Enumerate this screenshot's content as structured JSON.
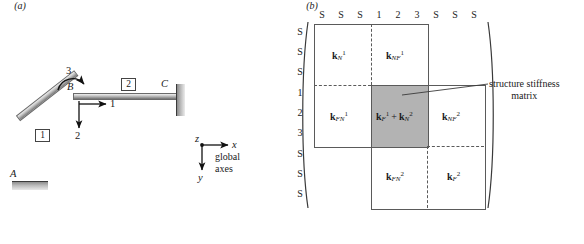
{
  "figure": {
    "panel_a": {
      "caption": "(a)",
      "joints": [
        {
          "name": "A",
          "role": "fixed-support-left"
        },
        {
          "name": "B",
          "role": "free-joint"
        },
        {
          "name": "C",
          "role": "fixed-support-right"
        }
      ],
      "members": [
        {
          "label": "1",
          "from": "A",
          "to": "B"
        },
        {
          "label": "2",
          "from": "B",
          "to": "C"
        }
      ],
      "dof_labels": [
        {
          "id": "1",
          "type": "translation-x",
          "arrow": "right"
        },
        {
          "id": "2",
          "type": "translation-y",
          "arrow": "down"
        },
        {
          "id": "3",
          "type": "rotation-z",
          "arrow": "curved"
        }
      ],
      "axes": {
        "origin_label": "z",
        "x_label": "x",
        "y_label": "y",
        "caption_line1": "global",
        "caption_line2": "axes"
      }
    },
    "panel_b": {
      "caption": "(b)",
      "column_headers": [
        "S",
        "S",
        "S",
        "1",
        "2",
        "3",
        "S",
        "S",
        "S"
      ],
      "row_headers": [
        "S",
        "S",
        "S",
        "1",
        "2",
        "3",
        "S",
        "S",
        "S"
      ],
      "blocks": [
        {
          "id": "kN1",
          "k": "k",
          "sub": "N",
          "sup": "1",
          "shaded": false
        },
        {
          "id": "kNF1",
          "k": "k",
          "sub": "NF",
          "sup": "1",
          "shaded": false
        },
        {
          "id": "kFN1",
          "k": "k",
          "sub": "FN",
          "sup": "1",
          "shaded": false
        },
        {
          "id": "kF1_kN2",
          "text": "kF1 + kN2",
          "shaded": true
        },
        {
          "id": "kNF2",
          "k": "k",
          "sub": "NF",
          "sup": "2",
          "shaded": false
        },
        {
          "id": "kFN2",
          "k": "k",
          "sub": "FN",
          "sup": "2",
          "shaded": false
        },
        {
          "id": "kF2",
          "k": "k",
          "sub": "F",
          "sup": "2",
          "shaded": false
        }
      ],
      "annotation": {
        "line1": "structure stiffness",
        "line2": "matrix"
      },
      "shaded_color": "#b3b3b3"
    }
  }
}
